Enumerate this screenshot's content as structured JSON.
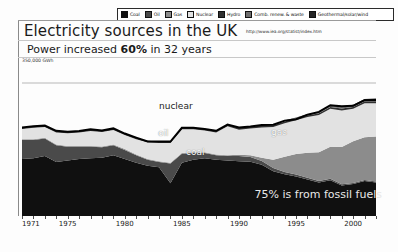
{
  "title": "Electricity sources in the UK",
  "subtitle_pre": "Power increased ",
  "subtitle_bold": "60%",
  "subtitle_post": " in 32 years",
  "source_url": "http://www.iea.org/statist/index.htm",
  "y_axis_label": "350,000 GWh",
  "annotation": "75% is from fossil fuels",
  "legend": {
    "items": [
      {
        "label": "Coal",
        "color": "#101010"
      },
      {
        "label": "Oil",
        "color": "#4a4a4a"
      },
      {
        "label": "Gas",
        "color": "#8c8c8c"
      },
      {
        "label": "Nuclear",
        "color": "#e2e2e2"
      },
      {
        "label": "Hydro",
        "color": "#303030"
      },
      {
        "label": "Comb. renew. & waste",
        "color": "#6e6e6e"
      },
      {
        "label": "Geothermal/solar/wind",
        "color": "#262626"
      }
    ]
  },
  "inline_labels": {
    "nuclear": "nuclear",
    "oil": "oil",
    "coal": "coal",
    "gas": "gas"
  },
  "chart_data": {
    "type": "area",
    "title": "Electricity sources in the UK",
    "subtitle": "Power increased 60% in 32 years",
    "xlabel": "",
    "ylabel": "350,000 GWh",
    "xlim": [
      1971,
      2002
    ],
    "ylim": [
      0,
      400000
    ],
    "y_gridline_value": 350000,
    "grid": true,
    "legend_position": "top",
    "stacked": true,
    "x": [
      1971,
      1972,
      1973,
      1974,
      1975,
      1976,
      1977,
      1978,
      1979,
      1980,
      1981,
      1982,
      1983,
      1984,
      1985,
      1986,
      1987,
      1988,
      1989,
      1990,
      1991,
      1992,
      1993,
      1994,
      1995,
      1996,
      1997,
      1998,
      1999,
      2000,
      2001,
      2002
    ],
    "xticks": [
      1971,
      1975,
      1980,
      1985,
      1990,
      1995,
      2000
    ],
    "xticklabels": [
      "1971",
      "1975",
      "1980",
      "1985",
      "1990",
      "1995",
      "2000"
    ],
    "series": [
      {
        "name": "Coal",
        "color": "#101010",
        "values": [
          150000,
          152000,
          158000,
          142000,
          146000,
          150000,
          152000,
          153000,
          160000,
          150000,
          140000,
          132000,
          128000,
          86000,
          140000,
          148000,
          152000,
          148000,
          146000,
          144000,
          143000,
          135000,
          118000,
          110000,
          104000,
          96000,
          88000,
          94000,
          80000,
          84000,
          92000,
          88000
        ]
      },
      {
        "name": "Oil",
        "color": "#4a4a4a",
        "values": [
          50000,
          48000,
          46000,
          44000,
          36000,
          32000,
          30000,
          28000,
          26000,
          24000,
          20000,
          16000,
          14000,
          52000,
          24000,
          18000,
          14000,
          12000,
          12000,
          14000,
          12000,
          10000,
          8000,
          6000,
          5000,
          4500,
          4000,
          4000,
          3500,
          3000,
          3000,
          3000
        ]
      },
      {
        "name": "Gas",
        "color": "#8c8c8c",
        "values": [
          2000,
          2000,
          2000,
          2000,
          2000,
          2000,
          2000,
          2000,
          2000,
          2000,
          2000,
          2000,
          2000,
          2000,
          2000,
          2000,
          2000,
          2000,
          2000,
          3000,
          5000,
          8000,
          22000,
          40000,
          54000,
          66000,
          76000,
          84000,
          98000,
          110000,
          112000,
          118000
        ]
      },
      {
        "name": "Nuclear",
        "color": "#e2e2e2",
        "values": [
          27000,
          30000,
          28000,
          32000,
          34000,
          36000,
          40000,
          38000,
          38000,
          37000,
          40000,
          44000,
          48000,
          52000,
          62000,
          60000,
          57000,
          58000,
          76000,
          66000,
          70000,
          80000,
          86000,
          88000,
          89000,
          94000,
          98000,
          100000,
          96000,
          85000,
          90000,
          88000
        ]
      },
      {
        "name": "Hydro",
        "color": "#303030",
        "values": [
          4000,
          4500,
          4000,
          4200,
          4000,
          3800,
          4200,
          4000,
          4500,
          4000,
          4200,
          4000,
          4200,
          4000,
          4000,
          4000,
          4000,
          4200,
          4500,
          5000,
          4600,
          5200,
          4800,
          5000,
          5000,
          4000,
          4200,
          5000,
          5200,
          5000,
          4000,
          4800
        ]
      },
      {
        "name": "Comb. renew. & waste",
        "color": "#6e6e6e",
        "values": [
          0,
          0,
          0,
          0,
          0,
          0,
          0,
          0,
          0,
          0,
          0,
          0,
          0,
          0,
          0,
          0,
          0,
          0,
          0,
          500,
          600,
          700,
          900,
          1100,
          1400,
          1800,
          2200,
          2600,
          3000,
          3400,
          3800,
          4200
        ]
      },
      {
        "name": "Geothermal/solar/wind",
        "color": "#262626",
        "values": [
          0,
          0,
          0,
          0,
          0,
          0,
          0,
          0,
          0,
          0,
          0,
          0,
          0,
          0,
          0,
          0,
          0,
          0,
          0,
          200,
          300,
          500,
          700,
          900,
          1100,
          1300,
          1600,
          1900,
          2200,
          2600,
          3000,
          3400
        ]
      }
    ],
    "totals": [
      233000,
      236500,
      238000,
      224200,
      222000,
      223800,
      228200,
      225000,
      230500,
      217000,
      206200,
      196000,
      196200,
      196000,
      232000,
      232000,
      229000,
      224200,
      240500,
      232700,
      235500,
      239400,
      240400,
      251000,
      254500,
      266600,
      274000,
      291500,
      288900,
      290000,
      304800,
      305400
    ]
  }
}
